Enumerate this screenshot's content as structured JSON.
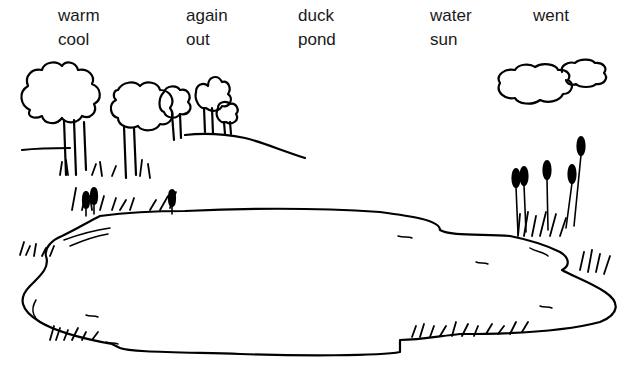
{
  "word_bank": {
    "rows": [
      [
        {
          "text": "warm",
          "x": 58,
          "y": 7
        },
        {
          "text": "again",
          "x": 186,
          "y": 7
        },
        {
          "text": "duck",
          "x": 298,
          "y": 7
        },
        {
          "text": "water",
          "x": 430,
          "y": 7
        },
        {
          "text": "went",
          "x": 533,
          "y": 7
        }
      ],
      [
        {
          "text": "cool",
          "x": 58,
          "y": 31
        },
        {
          "text": "out",
          "x": 186,
          "y": 31
        },
        {
          "text": "pond",
          "x": 298,
          "y": 31
        },
        {
          "text": "sun",
          "x": 430,
          "y": 31
        }
      ]
    ]
  },
  "illustration": {
    "subject": "pond scene",
    "elements": [
      "trees",
      "hill",
      "clouds",
      "cattails",
      "grass",
      "pond"
    ],
    "stroke_color": "#000000",
    "background_color": "#ffffff"
  }
}
